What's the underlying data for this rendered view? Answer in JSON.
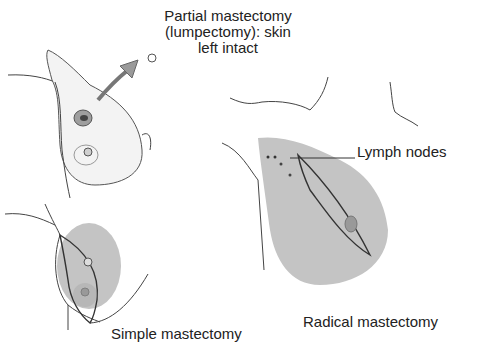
{
  "diagram": {
    "labels": {
      "partial_line1": "Partial mastectomy",
      "partial_line2": "(lumpectomy): skin",
      "partial_line3": "left intact",
      "lymph_nodes": "Lymph nodes",
      "simple": "Simple mastectomy",
      "radical": "Radical mastectomy"
    },
    "colors": {
      "shaded_region": "#c4c4c4",
      "outline": "#333333",
      "arrow": "#9a9a9a"
    }
  }
}
